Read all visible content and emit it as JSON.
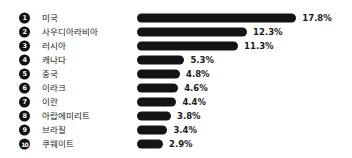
{
  "chart_data": {
    "type": "bar",
    "title": "",
    "subtitle": "",
    "xlabel": "",
    "ylabel": "",
    "orientation": "horizontal",
    "grid": false,
    "legend": "none",
    "value_suffix": "%",
    "xlim": [
      0,
      17.8
    ],
    "px_per_unit": 8.95,
    "categories": [
      "미국",
      "사우디아라비아",
      "러시아",
      "캐나다",
      "중국",
      "이라크",
      "이란",
      "아랍에미리트",
      "브라질",
      "쿠웨이트"
    ],
    "values": [
      17.8,
      12.3,
      11.3,
      5.3,
      4.8,
      4.6,
      4.4,
      3.8,
      3.4,
      2.9
    ],
    "value_labels": [
      "17.8%",
      "12.3%",
      "11.3%",
      "5.3%",
      "4.8%",
      "4.6%",
      "4.4%",
      "3.8%",
      "3.4%",
      "2.9%"
    ],
    "rank_labels": [
      "1",
      "2",
      "3",
      "4",
      "5",
      "6",
      "7",
      "8",
      "9",
      "10"
    ],
    "bar_color": "#141414",
    "background_color": "#ffffff",
    "text_color": "#1a1a1a"
  },
  "rows": [
    {
      "rank": "1",
      "label": "미국",
      "value_label": "17.8%",
      "value": 17.8
    },
    {
      "rank": "2",
      "label": "사우디아라비아",
      "value_label": "12.3%",
      "value": 12.3
    },
    {
      "rank": "3",
      "label": "러시아",
      "value_label": "11.3%",
      "value": 11.3
    },
    {
      "rank": "4",
      "label": "캐나다",
      "value_label": "5.3%",
      "value": 5.3
    },
    {
      "rank": "5",
      "label": "중국",
      "value_label": "4.8%",
      "value": 4.8
    },
    {
      "rank": "6",
      "label": "이라크",
      "value_label": "4.6%",
      "value": 4.6
    },
    {
      "rank": "7",
      "label": "이란",
      "value_label": "4.4%",
      "value": 4.4
    },
    {
      "rank": "8",
      "label": "아랍에미리트",
      "value_label": "3.8%",
      "value": 3.8
    },
    {
      "rank": "9",
      "label": "브라질",
      "value_label": "3.4%",
      "value": 3.4
    },
    {
      "rank": "10",
      "label": "쿠웨이트",
      "value_label": "2.9%",
      "value": 2.9
    }
  ]
}
